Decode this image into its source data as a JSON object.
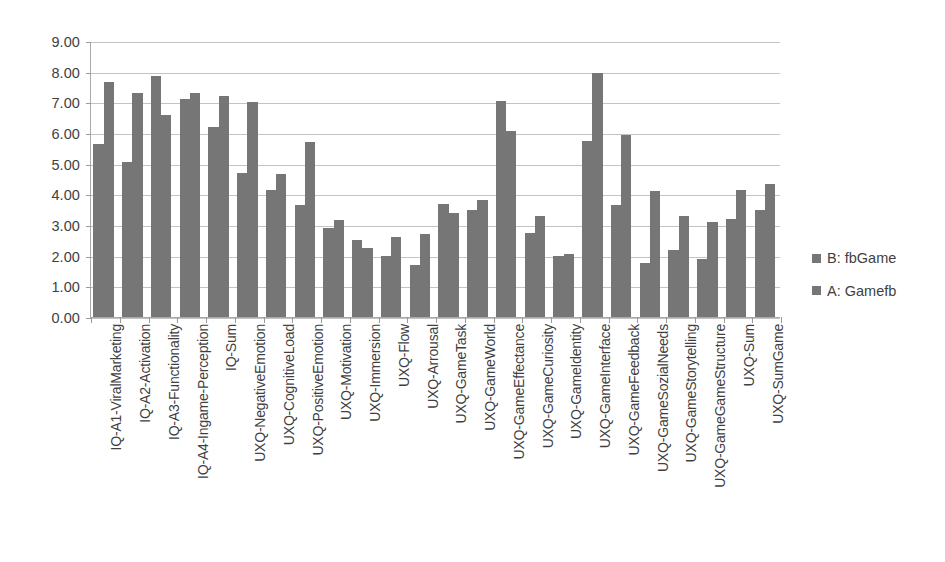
{
  "chart_data": {
    "type": "bar",
    "title": "",
    "xlabel": "",
    "ylabel": "",
    "ylim": [
      0,
      9
    ],
    "ytick_step": 1,
    "grid": true,
    "legend_position": "right",
    "bar_color": "#767676",
    "ytick_labels": [
      "9.00",
      "8.00",
      "7.00",
      "6.00",
      "5.00",
      "4.00",
      "3.00",
      "2.00",
      "1.00",
      "0.00"
    ],
    "categories": [
      "IQ-A1-ViralMarketing",
      "IQ-A2-Activation",
      "IQ-A3-Functionality",
      "IQ-A4-Ingame-Perception",
      "IQ-Sum",
      "UXQ-NegativeEmotion",
      "UXQ-CognitiveLoad",
      "UXQ-PositiveEmotion",
      "UXQ-Motivation",
      "UXQ-Immersion",
      "UXQ-Flow",
      "UXQ-Arrousal",
      "UXQ-GameTask",
      "UXQ-GameWorld",
      "UXQ-GameEffectance",
      "UXQ-GameCuriosity",
      "UXQ-GameIdentity",
      "UXQ-GameInterface",
      "UXQ-GameFeedback",
      "UXQ-GameSozialNeeds",
      "UXQ-GameStorytelling",
      "UXQ-GameGameStructure",
      "UXQ-Sum",
      "UXQ-SumGame"
    ],
    "series": [
      {
        "name": "B: fbGame",
        "color": "#767676",
        "values": [
          5.65,
          5.05,
          7.85,
          7.1,
          6.2,
          4.7,
          4.15,
          3.65,
          2.9,
          2.5,
          2.0,
          1.7,
          3.7,
          3.5,
          7.05,
          2.75,
          2.0,
          5.75,
          3.65,
          1.75,
          2.2,
          1.9,
          3.2,
          3.5
        ]
      },
      {
        "name": "A: Gamefb",
        "color": "#767676",
        "values": [
          7.65,
          7.3,
          6.6,
          7.3,
          7.2,
          7.0,
          4.65,
          5.7,
          3.15,
          2.25,
          2.6,
          2.7,
          3.4,
          3.8,
          6.05,
          3.3,
          2.05,
          7.95,
          5.95,
          4.1,
          3.3,
          3.1,
          4.15,
          4.35
        ]
      }
    ]
  },
  "legend": {
    "items": [
      {
        "label": "B: fbGame"
      },
      {
        "label": "A: Gamefb"
      }
    ]
  }
}
